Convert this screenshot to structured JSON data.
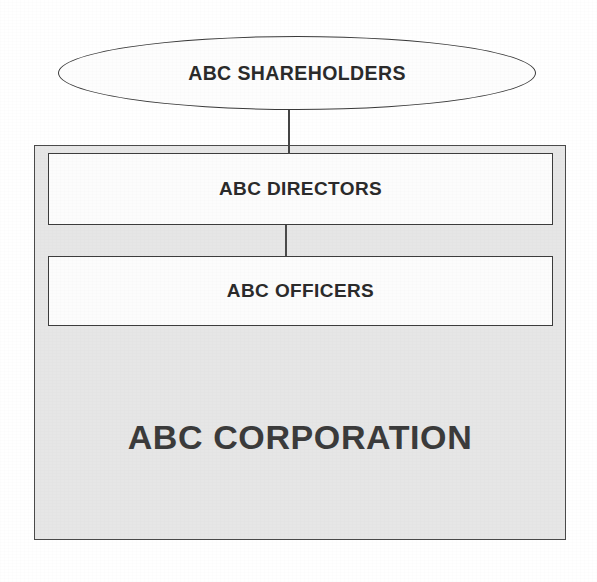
{
  "diagram": {
    "type": "organizational-hierarchy",
    "nodes": {
      "shareholders": {
        "label": "ABC SHAREHOLDERS",
        "shape": "ellipse",
        "fill_color": "#fdfdfd",
        "border_color": "#3a3a3a",
        "text_color": "#2b2b2b"
      },
      "corporation": {
        "label": "ABC CORPORATION",
        "shape": "rectangle",
        "fill_color": "#e6e6e6",
        "border_color": "#4a4a4a",
        "text_color": "#3b3b3b"
      },
      "directors": {
        "label": "ABC DIRECTORS",
        "shape": "rectangle",
        "fill_color": "#fcfcfc",
        "border_color": "#3d3d3d",
        "text_color": "#2b2b2b"
      },
      "officers": {
        "label": "ABC OFFICERS",
        "shape": "rectangle",
        "fill_color": "#fcfcfc",
        "border_color": "#3d3d3d",
        "text_color": "#2b2b2b"
      }
    },
    "connectors": [
      {
        "id": "shareholders-to-directors",
        "from": "shareholders",
        "to": "directors",
        "style": "straight-vertical-line",
        "color": "#454545"
      },
      {
        "id": "directors-to-officers",
        "from": "directors",
        "to": "officers",
        "style": "straight-vertical-line",
        "color": "#4a4a4a"
      }
    ],
    "page_background": "#ffffff"
  }
}
